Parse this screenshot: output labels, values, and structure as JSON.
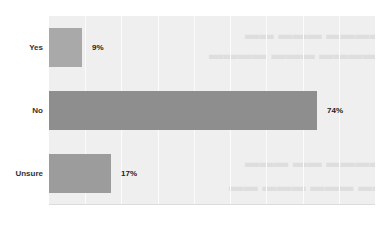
{
  "chart_data": {
    "type": "bar",
    "orientation": "horizontal",
    "title": "",
    "xlabel": "",
    "ylabel": "",
    "categories": [
      "Yes",
      "No",
      "Unsure"
    ],
    "values": [
      9,
      74,
      17
    ],
    "value_labels": [
      "9%",
      "74%",
      "17%"
    ],
    "unit": "%",
    "xlim": [
      0,
      90
    ],
    "grid": true,
    "legend": null,
    "colors": [
      "#a9a9a9",
      "#8e8e8e",
      "#9c9c9c"
    ]
  },
  "plot": {
    "background": "#efefef",
    "gridline_color": "#fbfbfb"
  }
}
